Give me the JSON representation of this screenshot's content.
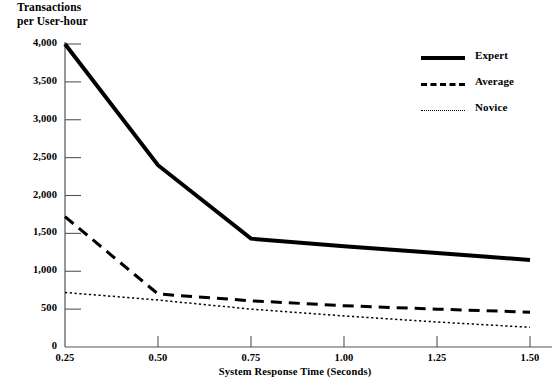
{
  "chart_data": {
    "type": "line",
    "title": "",
    "xlabel": "System Response Time (Seconds)",
    "ylabel": "Transactions\nper User-hour",
    "x": [
      0.25,
      0.5,
      0.75,
      1.0,
      1.25,
      1.5
    ],
    "xtick_labels": [
      "0.25",
      "0.50",
      "0.75",
      "1.00",
      "1.25",
      "1.50"
    ],
    "ytick_labels": [
      "0",
      "500",
      "1,000",
      "1,500",
      "2,000",
      "2,500",
      "3,000",
      "3,500",
      "4,000"
    ],
    "ytick_values": [
      0,
      500,
      1000,
      1500,
      2000,
      2500,
      3000,
      3500,
      4000
    ],
    "xlim": [
      0.25,
      1.5
    ],
    "ylim": [
      0,
      4000
    ],
    "grid": false,
    "legend_position": "upper right",
    "series": [
      {
        "name": "Expert",
        "style": "solid",
        "color": "#000000",
        "width": 4,
        "values": [
          4000,
          2400,
          1430,
          1330,
          1240,
          1150
        ]
      },
      {
        "name": "Average",
        "style": "dashed",
        "color": "#000000",
        "width": 3,
        "values": [
          1720,
          700,
          610,
          545,
          500,
          460
        ]
      },
      {
        "name": "Novice",
        "style": "dotted",
        "color": "#000000",
        "width": 1.5,
        "values": [
          720,
          620,
          500,
          410,
          330,
          260
        ]
      }
    ]
  },
  "axis_labels": {
    "y_line1": "Transactions",
    "y_line2": "per User-hour",
    "x_title": "System Response Time (Seconds)"
  },
  "legend": {
    "items": [
      {
        "label": "Expert",
        "swatch": "solid-line-swatch"
      },
      {
        "label": "Average",
        "swatch": "dashed-line-swatch"
      },
      {
        "label": "Novice",
        "swatch": "dotted-line-swatch"
      }
    ]
  },
  "footnote": {
    "text": ""
  },
  "colors": {
    "line": "#000000",
    "axis": "#555555",
    "background": "#ffffff"
  }
}
